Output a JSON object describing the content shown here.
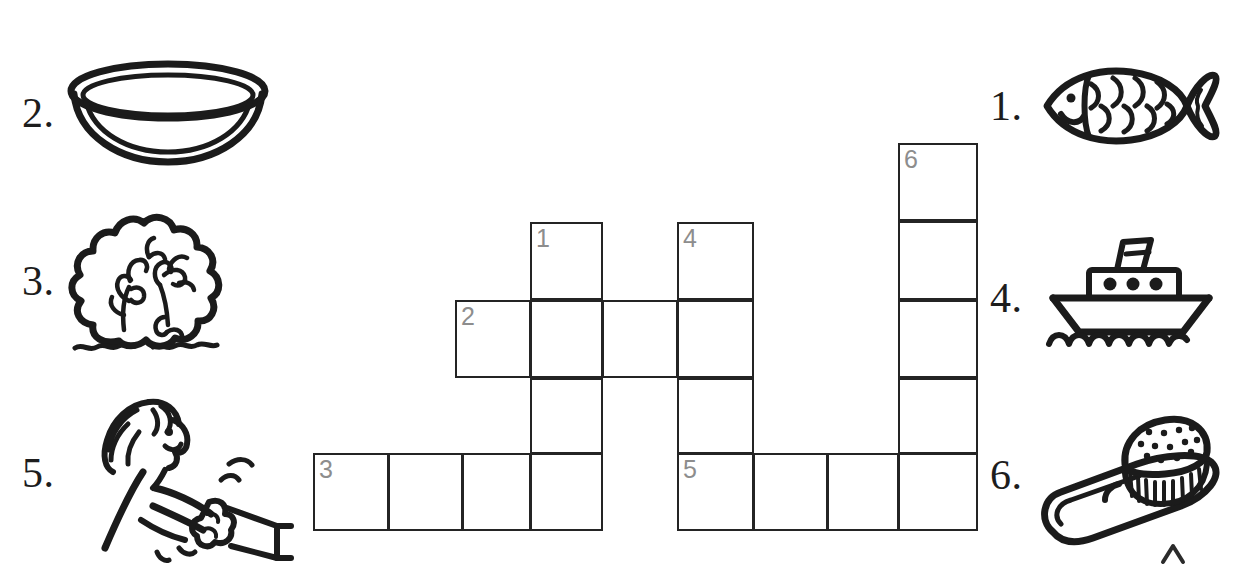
{
  "worksheet": {
    "title": "Picture Crossword Puzzle",
    "type": "picture-crossword",
    "clue_count": 6
  },
  "clues": [
    {
      "number": "1.",
      "id": "clue-1",
      "picture": "fish",
      "direction": "down",
      "answer_length": 4,
      "side": "right"
    },
    {
      "number": "2.",
      "id": "clue-2",
      "picture": "bowl",
      "direction": "across",
      "answer_length": 4,
      "side": "left"
    },
    {
      "number": "3.",
      "id": "clue-3",
      "picture": "bush",
      "direction": "across",
      "answer_length": 4,
      "side": "left"
    },
    {
      "number": "4.",
      "id": "clue-4",
      "picture": "ship",
      "direction": "down",
      "answer_length": 4,
      "side": "right"
    },
    {
      "number": "5.",
      "id": "clue-5",
      "picture": "push",
      "direction": "across",
      "answer_length": 4,
      "side": "left"
    },
    {
      "number": "6.",
      "id": "clue-6",
      "picture": "brush",
      "direction": "down",
      "answer_length": 5,
      "side": "right"
    }
  ],
  "grid": {
    "cell_width": 75,
    "cell_height": 78,
    "cells": [
      {
        "id": "c6r0",
        "x": 898,
        "y": 143,
        "w": 80,
        "h": 78,
        "number": "6"
      },
      {
        "id": "c6r1",
        "x": 898,
        "y": 221,
        "w": 80,
        "h": 79,
        "number": ""
      },
      {
        "id": "c1r0",
        "x": 530,
        "y": 222,
        "w": 73,
        "h": 78,
        "number": "1"
      },
      {
        "id": "c4r0",
        "x": 677,
        "y": 222,
        "w": 77,
        "h": 78,
        "number": "4"
      },
      {
        "id": "c2a0",
        "x": 455,
        "y": 300,
        "w": 76,
        "h": 78,
        "number": "2"
      },
      {
        "id": "c2a1",
        "x": 530,
        "y": 300,
        "w": 73,
        "h": 78,
        "number": ""
      },
      {
        "id": "c2a2",
        "x": 602,
        "y": 300,
        "w": 76,
        "h": 78,
        "number": ""
      },
      {
        "id": "c2a3",
        "x": 677,
        "y": 300,
        "w": 77,
        "h": 78,
        "number": ""
      },
      {
        "id": "c6r2",
        "x": 898,
        "y": 300,
        "w": 80,
        "h": 78,
        "number": ""
      },
      {
        "id": "c1r2",
        "x": 530,
        "y": 378,
        "w": 73,
        "h": 76,
        "number": ""
      },
      {
        "id": "c4r2",
        "x": 677,
        "y": 378,
        "w": 77,
        "h": 76,
        "number": ""
      },
      {
        "id": "c6r3",
        "x": 898,
        "y": 378,
        "w": 80,
        "h": 76,
        "number": ""
      },
      {
        "id": "c3a0",
        "x": 313,
        "y": 453,
        "w": 76,
        "h": 78,
        "number": "3"
      },
      {
        "id": "c3a1",
        "x": 388,
        "y": 453,
        "w": 75,
        "h": 78,
        "number": ""
      },
      {
        "id": "c3a2",
        "x": 462,
        "y": 453,
        "w": 69,
        "h": 78,
        "number": ""
      },
      {
        "id": "c3a3",
        "x": 530,
        "y": 453,
        "w": 73,
        "h": 78,
        "number": ""
      },
      {
        "id": "c5a0",
        "x": 677,
        "y": 453,
        "w": 77,
        "h": 78,
        "number": "5"
      },
      {
        "id": "c5a1",
        "x": 753,
        "y": 453,
        "w": 75,
        "h": 78,
        "number": ""
      },
      {
        "id": "c5a2",
        "x": 827,
        "y": 453,
        "w": 72,
        "h": 78,
        "number": ""
      },
      {
        "id": "c5a3",
        "x": 898,
        "y": 453,
        "w": 80,
        "h": 78,
        "number": ""
      }
    ]
  },
  "marks": {
    "caret": "^"
  }
}
